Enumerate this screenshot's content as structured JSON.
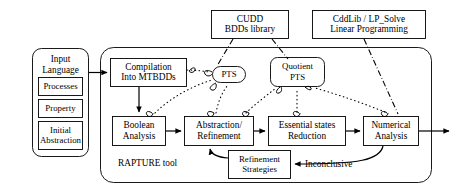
{
  "diagram": {
    "tool_label": "RAPTURE tool",
    "inconclusive_label": "Inconclusive",
    "nodes": {
      "input_language": {
        "line1": "Input",
        "line2": "Language"
      },
      "processes": {
        "label": "Processes"
      },
      "property": {
        "label": "Property"
      },
      "initial_abstraction": {
        "line1": "Initial",
        "line2": "Abstraction"
      },
      "compilation": {
        "line1": "Compilation",
        "line2": "Into MTBDDs"
      },
      "boolean_analysis": {
        "line1": "Boolean",
        "line2": "Analysis"
      },
      "abstraction_refinement": {
        "line1": "Abstraction/",
        "line2": "Refinement"
      },
      "essential_states": {
        "line1": "Essential states",
        "line2": "Reduction"
      },
      "numerical_analysis": {
        "line1": "Numerical",
        "line2": "Analysis"
      },
      "refinement_strategies": {
        "line1": "Refinement",
        "line2": "Strategies"
      },
      "pts": {
        "label": "PTS"
      },
      "quotient_pts": {
        "line1": "Quotient",
        "line2": "PTS"
      },
      "cudd": {
        "line1": "CUDD",
        "line2": "BDDs library"
      },
      "cddlib": {
        "line1": "CddLib / LP_Solve",
        "line2": "Linear Programming"
      }
    },
    "colors": {
      "stroke": "#000000",
      "background": "#ffffff",
      "fill": "#ffffff"
    }
  }
}
